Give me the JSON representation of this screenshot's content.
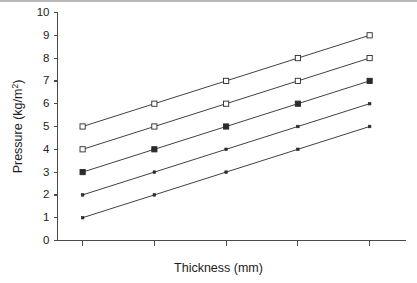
{
  "chart_data": {
    "type": "line",
    "title": "",
    "xlabel": "Thickness (mm)",
    "ylabel": "Pressure (kg/m²)",
    "ylabel_base": "Pressure (kg/m",
    "ylabel_sup": "2",
    "ylabel_close": ")",
    "x": [
      1,
      2,
      3,
      4,
      5
    ],
    "xtick_labels": [
      "",
      "",
      "",
      "",
      ""
    ],
    "ytick_labels": [
      "0",
      "1",
      "2",
      "3",
      "4",
      "5",
      "6",
      "7",
      "8",
      "9",
      "10"
    ],
    "ylim": [
      0,
      10
    ],
    "ytick_step": 1,
    "xlim": [
      0.65,
      5.5
    ],
    "grid": false,
    "legend": "none",
    "line_color": "#2b2b2b",
    "axis_color": "#4a4a4a",
    "background": "#ffffff",
    "series": [
      {
        "name": "series-1",
        "marker": "open-square",
        "values": [
          5,
          6,
          7,
          8,
          9
        ]
      },
      {
        "name": "series-2",
        "marker": "open-square",
        "values": [
          4,
          5,
          6,
          7,
          8
        ]
      },
      {
        "name": "series-3",
        "marker": "filled-square",
        "values": [
          3,
          4,
          5,
          6,
          7
        ]
      },
      {
        "name": "series-4",
        "marker": "dot",
        "values": [
          2,
          3,
          4,
          5,
          6
        ]
      },
      {
        "name": "series-5",
        "marker": "dot",
        "values": [
          1,
          2,
          3,
          4,
          5
        ]
      }
    ]
  }
}
